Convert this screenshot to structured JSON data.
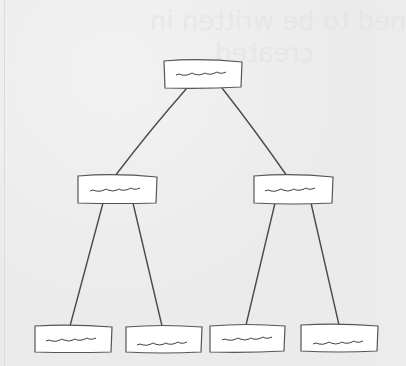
{
  "diagram": {
    "type": "tree",
    "colors": {
      "background": "#ebebeb",
      "node_fill": "#ffffff",
      "stroke": "#4a4a4a"
    },
    "ghost_text": {
      "line1": "ned to be written in",
      "line2": "created"
    },
    "nodes": [
      {
        "id": "root",
        "level": 0,
        "label": "~~~~",
        "x": 164,
        "y": 60,
        "w": 78,
        "h": 28
      },
      {
        "id": "mid-left",
        "level": 1,
        "label": "~~~~",
        "x": 77,
        "y": 175,
        "w": 80,
        "h": 28
      },
      {
        "id": "mid-right",
        "level": 1,
        "label": "~~~~",
        "x": 253,
        "y": 175,
        "w": 80,
        "h": 28
      },
      {
        "id": "leaf-1",
        "level": 2,
        "label": "~~~~",
        "x": 34,
        "y": 325,
        "w": 78,
        "h": 27
      },
      {
        "id": "leaf-2",
        "level": 2,
        "label": "~~~~",
        "x": 125,
        "y": 325,
        "w": 77,
        "h": 27
      },
      {
        "id": "leaf-3",
        "level": 2,
        "label": "~~~~",
        "x": 209,
        "y": 324,
        "w": 76,
        "h": 28
      },
      {
        "id": "leaf-4",
        "level": 2,
        "label": "~~~~",
        "x": 300,
        "y": 324,
        "w": 78,
        "h": 28
      }
    ],
    "edges": [
      {
        "from": "root",
        "to": "mid-left"
      },
      {
        "from": "root",
        "to": "mid-right"
      },
      {
        "from": "mid-left",
        "to": "leaf-1"
      },
      {
        "from": "mid-left",
        "to": "leaf-2"
      },
      {
        "from": "mid-right",
        "to": "leaf-3"
      },
      {
        "from": "mid-right",
        "to": "leaf-4"
      }
    ]
  }
}
